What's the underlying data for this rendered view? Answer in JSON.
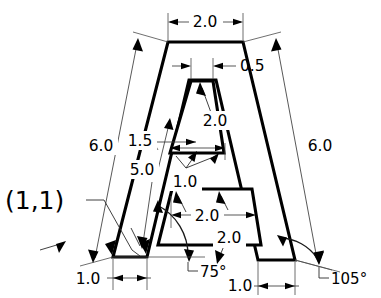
{
  "drawing": {
    "title": "Dimensioned letter A profile",
    "origin_label": "(1,1)",
    "units_implied": "inches",
    "stroke_color": "#000000",
    "background_color": "#ffffff",
    "dimensions": {
      "top_width": "2.0",
      "inner_top_gap": "0.5",
      "left_leg_outer": "6.0",
      "right_leg_outer": "6.0",
      "inner_left_leg": "5.0",
      "inner_offset": "1.5",
      "inner_upper_triangle_height": "2.0",
      "crossbar_thickness": "1.0",
      "lower_opening_width": "2.0",
      "lower_opening_height": "2.0",
      "left_foot_width": "1.0",
      "right_foot_width": "1.0"
    },
    "angles": {
      "left_base_angle": "75°",
      "right_base_angle": "105°"
    },
    "labels": [
      {
        "id": "top-width",
        "text": "2.0",
        "x": 205,
        "y": 27,
        "anchor": "middle"
      },
      {
        "id": "inner-gap",
        "text": "0.5",
        "x": 240,
        "y": 71,
        "anchor": "start"
      },
      {
        "id": "left-leg",
        "text": "6.0",
        "x": 101,
        "y": 148,
        "anchor": "middle"
      },
      {
        "id": "right-leg",
        "text": "6.0",
        "x": 320,
        "y": 148,
        "anchor": "middle"
      },
      {
        "id": "inner-offset",
        "text": "1.5",
        "x": 140,
        "y": 144,
        "anchor": "middle"
      },
      {
        "id": "inner-leg",
        "text": "5.0",
        "x": 142,
        "y": 172,
        "anchor": "middle"
      },
      {
        "id": "upper-tri-height",
        "text": "2.0",
        "x": 215,
        "y": 124,
        "anchor": "middle"
      },
      {
        "id": "crossbar",
        "text": "1.0",
        "x": 185,
        "y": 184,
        "anchor": "middle"
      },
      {
        "id": "lower-width",
        "text": "2.0",
        "x": 207,
        "y": 219,
        "anchor": "middle"
      },
      {
        "id": "lower-height",
        "text": "2.0",
        "x": 229,
        "y": 240,
        "anchor": "middle"
      },
      {
        "id": "left-foot",
        "text": "1.0",
        "x": 88,
        "y": 283,
        "anchor": "middle"
      },
      {
        "id": "right-foot",
        "text": "1.0",
        "x": 240,
        "y": 290,
        "anchor": "middle"
      },
      {
        "id": "left-angle",
        "text": "75°",
        "x": 200,
        "y": 281,
        "anchor": "start"
      },
      {
        "id": "right-angle",
        "text": "105°",
        "x": 331,
        "y": 290,
        "anchor": "start"
      }
    ],
    "geometry": {
      "outer_path": "M 113 257 L 168 42 L 243 42 L 295 260 L 258 260 L 214 79 L 206 79 L 147 257 Z",
      "outer_note": "letter A body with tapered legs",
      "inner_upper": "M 190 80 L 212 80 L 222 152 L 171 152 Z",
      "inner_lower": "M 173 188 L 253 188 L 259 243 L 160 243 Z"
    }
  }
}
